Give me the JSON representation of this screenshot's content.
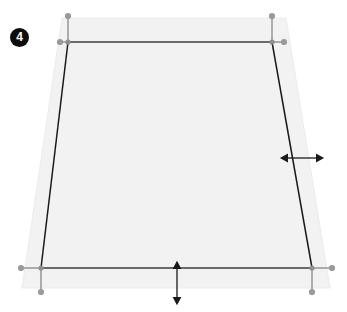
{
  "diagram": {
    "step_badge": {
      "label": "4",
      "background_color": "#0d0d0d",
      "text_color": "#ffffff"
    },
    "canvas": {
      "width": 347,
      "height": 312,
      "background_color": "#ffffff"
    },
    "surface": {
      "name": "projection-surface",
      "fill_color": "#f2f2f2",
      "stroke_color": "#ededed",
      "points": "62,18 286,18 330,288 22,288"
    },
    "trapezoid": {
      "name": "keystone-outline",
      "stroke_color": "#1a1a1a",
      "stroke_width": 1.4,
      "corners": [
        {
          "id": "top-left",
          "x": 68,
          "y": 42
        },
        {
          "id": "top-right",
          "x": 272,
          "y": 42
        },
        {
          "id": "bottom-right",
          "x": 312,
          "y": 268
        },
        {
          "id": "bottom-left",
          "x": 41,
          "y": 268
        }
      ]
    },
    "edges": [
      {
        "id": "top-edge",
        "x1": 68,
        "y1": 42,
        "x2": 272,
        "y2": 42,
        "stroke": "#3c3c3c"
      },
      {
        "id": "bottom-edge",
        "x1": 41,
        "y1": 268,
        "x2": 312,
        "y2": 268,
        "stroke": "#3c3c3c"
      },
      {
        "id": "left-edge",
        "x1": 68,
        "y1": 42,
        "x2": 41,
        "y2": 268,
        "stroke": "#1a1a1a"
      },
      {
        "id": "right-edge",
        "x1": 272,
        "y1": 42,
        "x2": 312,
        "y2": 268,
        "stroke": "#1a1a1a"
      }
    ],
    "handles": [
      {
        "id": "handle-top-left",
        "x": 68,
        "y": 42,
        "stem_vertical": {
          "x1": 68,
          "y1": 42,
          "x2": 68,
          "y2": 16
        },
        "dot_vertical": {
          "cx": 68,
          "cy": 16
        },
        "stem_horizontal": {
          "x1": 68,
          "y1": 42,
          "x2": 60,
          "y2": 42
        },
        "dot_horizontal": {
          "cx": 60,
          "cy": 42
        },
        "color": "#9a9a9a"
      },
      {
        "id": "handle-top-right",
        "x": 272,
        "y": 42,
        "stem_vertical": {
          "x1": 272,
          "y1": 42,
          "x2": 272,
          "y2": 16
        },
        "dot_vertical": {
          "cx": 272,
          "cy": 16
        },
        "stem_horizontal": {
          "x1": 272,
          "y1": 42,
          "x2": 284,
          "y2": 42
        },
        "dot_horizontal": {
          "cx": 284,
          "cy": 42
        },
        "color": "#9a9a9a"
      },
      {
        "id": "handle-bottom-left",
        "x": 41,
        "y": 268,
        "stem_vertical": {
          "x1": 41,
          "y1": 268,
          "x2": 41,
          "y2": 292
        },
        "dot_vertical": {
          "cx": 41,
          "cy": 292
        },
        "stem_horizontal": {
          "x1": 41,
          "y1": 268,
          "x2": 21,
          "y2": 268
        },
        "dot_horizontal": {
          "cx": 21,
          "cy": 268
        },
        "color": "#9a9a9a"
      },
      {
        "id": "handle-bottom-right",
        "x": 312,
        "y": 268,
        "stem_vertical": {
          "x1": 312,
          "y1": 268,
          "x2": 312,
          "y2": 292
        },
        "dot_vertical": {
          "cx": 312,
          "cy": 292
        },
        "stem_horizontal": {
          "x1": 312,
          "y1": 268,
          "x2": 332,
          "y2": 268
        },
        "dot_horizontal": {
          "cx": 332,
          "cy": 268
        },
        "color": "#9a9a9a"
      }
    ],
    "dimension_arrows": [
      {
        "id": "horizontal-adjust-arrow",
        "orientation": "horizontal",
        "x1": 287,
        "y1": 158,
        "x2": 317,
        "y2": 158,
        "color": "#1a1a1a"
      },
      {
        "id": "vertical-adjust-arrow",
        "orientation": "vertical",
        "x1": 177,
        "y1": 268,
        "x2": 177,
        "y2": 298,
        "color": "#1a1a1a"
      }
    ]
  }
}
